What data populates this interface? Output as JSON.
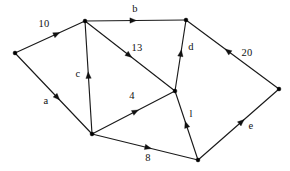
{
  "figure": {
    "background_color": "#ffffff",
    "stroke_color": "#111111",
    "node_color": "#000000",
    "width": 290,
    "height": 171
  },
  "graph_data": {
    "type": "directed-weighted-graph",
    "node_count": 7,
    "edge_count": 11,
    "nodes": [
      {
        "id": "A",
        "x": 15,
        "y": 53,
        "name": "node-a-left"
      },
      {
        "id": "B",
        "x": 85,
        "y": 21,
        "name": "node-b-top-middle"
      },
      {
        "id": "C",
        "x": 186,
        "y": 20,
        "name": "node-c-top-right"
      },
      {
        "id": "D",
        "x": 279,
        "y": 89,
        "name": "node-d-right"
      },
      {
        "id": "E",
        "x": 175,
        "y": 91,
        "name": "node-e-center"
      },
      {
        "id": "F",
        "x": 92,
        "y": 134,
        "name": "node-f-bottom-left"
      },
      {
        "id": "G",
        "x": 198,
        "y": 160,
        "name": "node-g-bottom-right"
      }
    ],
    "edges": [
      {
        "id": "e1",
        "from": "A",
        "to": "B",
        "label": "10",
        "label_x": 44,
        "label_y": 24,
        "arrow_t": 0.64
      },
      {
        "id": "e2",
        "from": "B",
        "to": "C",
        "label": "b",
        "label_x": 135,
        "label_y": 9,
        "arrow_t": 0.51
      },
      {
        "id": "e3",
        "from": "B",
        "to": "E",
        "label": "13",
        "label_x": 137,
        "label_y": 48,
        "arrow_t": 0.52
      },
      {
        "id": "e4",
        "from": "F",
        "to": "B",
        "label": "c",
        "label_x": 78,
        "label_y": 74,
        "arrow_t": 0.55
      },
      {
        "id": "e5",
        "from": "A",
        "to": "F",
        "label": "a",
        "label_x": 46,
        "label_y": 101,
        "arrow_t": 0.58
      },
      {
        "id": "e6",
        "from": "F",
        "to": "E",
        "label": "4",
        "label_x": 132,
        "label_y": 96,
        "arrow_t": 0.56
      },
      {
        "id": "e7",
        "from": "E",
        "to": "C",
        "label": "d",
        "label_x": 191,
        "label_y": 47,
        "arrow_t": 0.58
      },
      {
        "id": "e8",
        "from": "D",
        "to": "C",
        "label": "20",
        "label_x": 247,
        "label_y": 53,
        "arrow_t": 0.58
      },
      {
        "id": "e9",
        "from": "G",
        "to": "E",
        "label": "l",
        "label_x": 191,
        "label_y": 114,
        "arrow_t": 0.56
      },
      {
        "id": "e10",
        "from": "G",
        "to": "D",
        "label": "e",
        "label_x": 251,
        "label_y": 126,
        "arrow_t": 0.57
      },
      {
        "id": "e11",
        "from": "F",
        "to": "G",
        "label": "8",
        "label_x": 148,
        "label_y": 158,
        "arrow_t": 0.56
      }
    ],
    "labels": [
      "10",
      "b",
      "13",
      "c",
      "a",
      "4",
      "d",
      "20",
      "l",
      "e",
      "8"
    ]
  }
}
